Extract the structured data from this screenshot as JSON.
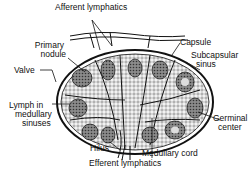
{
  "diagram": {
    "colors": {
      "ink": "#111111",
      "background": "#ffffff",
      "tissue_fill": "#e6e6e6",
      "nodule_fill": "#9a9a9a"
    },
    "labels": {
      "afferent_lymphatics": "Afferent lymphatics",
      "primary_nodule_1": "Primary",
      "primary_nodule_2": "nodule",
      "valve": "Valve",
      "capsule": "Capsule",
      "subcapsular_sinus_1": "Subcapsular",
      "subcapsular_sinus_2": "sinus",
      "lymph_medullary_1": "Lymph in",
      "lymph_medullary_2": "medullary",
      "lymph_medullary_3": "sinuses",
      "germinal_center_1": "Germinal",
      "germinal_center_2": "center",
      "hilus": "Hilus",
      "medullary_cord": "Medullary cord",
      "efferent_lymphatics": "Efferent lymphatics"
    }
  }
}
